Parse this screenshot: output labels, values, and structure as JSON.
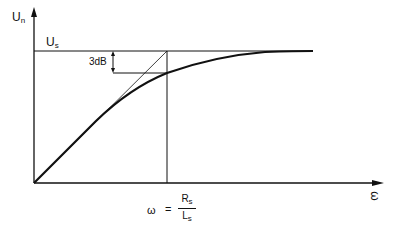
{
  "diagram": {
    "type": "frequency-response-sketch",
    "y_axis": {
      "label_main": "U",
      "label_sub": "n"
    },
    "x_axis": {
      "label": "ω"
    },
    "asymptote_label": {
      "main": "U",
      "sub": "s"
    },
    "attenuation_label": "3dB",
    "corner_frequency": {
      "lhs": "ω",
      "equals": "=",
      "numerator_main": "R",
      "numerator_sub": "s",
      "denominator_main": "L",
      "denominator_sub": "s"
    },
    "colors": {
      "ink": "#111111",
      "background": "#ffffff"
    }
  }
}
